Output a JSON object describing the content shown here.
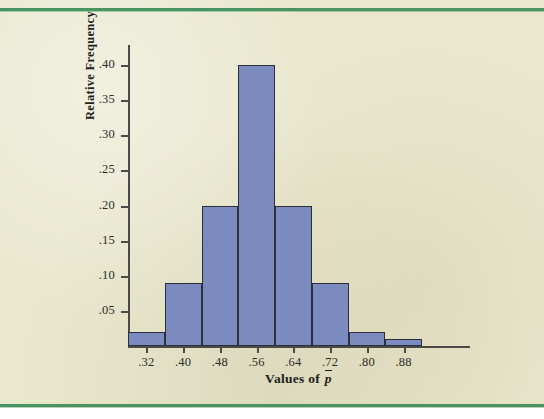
{
  "figure": {
    "background_color": "#e9e7cd",
    "rule_color": "#4a9461",
    "bar_fill_color": "#7b8bc0",
    "bar_edge_color": "#2d2f38",
    "axis_color": "#4a4a48"
  },
  "chart_data": {
    "type": "bar",
    "title": "",
    "subtitle": "",
    "xlabel": "Values of p̄",
    "xlabel_plain": "Values of p-bar",
    "ylabel": "Relative Frequency",
    "grid": false,
    "legend": null,
    "xlim": [
      0.28,
      0.92
    ],
    "ylim": [
      0.0,
      0.42
    ],
    "bin_width": 0.08,
    "bin_edges": [
      0.28,
      0.36,
      0.44,
      0.52,
      0.6,
      0.68,
      0.76,
      0.84,
      0.92
    ],
    "categories": [
      ".28-.36",
      ".36-.44",
      ".44-.52",
      ".52-.60",
      ".60-.68",
      ".68-.76",
      ".76-.84",
      ".84-.92"
    ],
    "values": [
      0.02,
      0.09,
      0.2,
      0.4,
      0.2,
      0.09,
      0.02,
      0.01
    ],
    "xticks": [
      0.32,
      0.4,
      0.48,
      0.56,
      0.64,
      0.72,
      0.8,
      0.88
    ],
    "xtick_labels": [
      ".32",
      ".40",
      ".48",
      ".56",
      ".64",
      ".72",
      ".80",
      ".88"
    ],
    "yticks": [
      0.05,
      0.1,
      0.15,
      0.2,
      0.25,
      0.3,
      0.35,
      0.4
    ],
    "ytick_labels": [
      ".05",
      ".10",
      ".15",
      ".20",
      ".25",
      ".30",
      ".35",
      ".40"
    ]
  }
}
